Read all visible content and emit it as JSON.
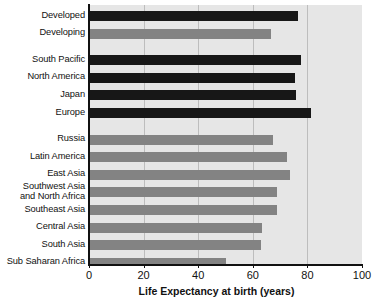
{
  "chart_data": {
    "type": "bar",
    "orientation": "horizontal",
    "title": "",
    "xlabel": "Life Expectancy at birth (years)",
    "ylabel": "",
    "xlim": [
      0,
      100
    ],
    "xticks": [
      0,
      20,
      40,
      60,
      80,
      100
    ],
    "grid": true,
    "legend": "none",
    "colors": {
      "dark_series": "#171717",
      "light_series": "#838383",
      "plot_background": "#e6e6e6",
      "gridline": "#bdbdbd",
      "axis": "#111111",
      "text": "#111111"
    },
    "categories": [
      "Developed",
      "Developing",
      "South Pacific",
      "North America",
      "Japan",
      "Europe",
      "Russia",
      "Latin America",
      "East Asia",
      "Southwest Asia and North Africa",
      "Southeast Asia",
      "Central Asia",
      "South Asia",
      "Sub Saharan Africa"
    ],
    "values": [
      76.5,
      66.5,
      77.5,
      75.5,
      76.0,
      81.5,
      67.5,
      72.5,
      73.5,
      69.0,
      69.0,
      63.5,
      63.0,
      50.0
    ],
    "bars": [
      {
        "label": "Developed",
        "label_lines": [
          "Developed"
        ],
        "value": 76.5,
        "shade": "dark",
        "group": 0
      },
      {
        "label": "Developing",
        "label_lines": [
          "Developing"
        ],
        "value": 66.5,
        "shade": "light",
        "group": 0
      },
      {
        "label": "South Pacific",
        "label_lines": [
          "South Pacific"
        ],
        "value": 77.5,
        "shade": "dark",
        "group": 1
      },
      {
        "label": "North America",
        "label_lines": [
          "North America"
        ],
        "value": 75.5,
        "shade": "dark",
        "group": 1
      },
      {
        "label": "Japan",
        "label_lines": [
          "Japan"
        ],
        "value": 76.0,
        "shade": "dark",
        "group": 1
      },
      {
        "label": "Europe",
        "label_lines": [
          "Europe"
        ],
        "value": 81.5,
        "shade": "dark",
        "group": 1
      },
      {
        "label": "Russia",
        "label_lines": [
          "Russia"
        ],
        "value": 67.5,
        "shade": "light",
        "group": 2
      },
      {
        "label": "Latin America",
        "label_lines": [
          "Latin America"
        ],
        "value": 72.5,
        "shade": "light",
        "group": 2
      },
      {
        "label": "East Asia",
        "label_lines": [
          "East Asia"
        ],
        "value": 73.5,
        "shade": "light",
        "group": 2
      },
      {
        "label": "Southwest Asia and North Africa",
        "label_lines": [
          "Southwest Asia",
          "and North Africa"
        ],
        "value": 69.0,
        "shade": "light",
        "group": 2
      },
      {
        "label": "Southeast Asia",
        "label_lines": [
          "Southeast Asia"
        ],
        "value": 69.0,
        "shade": "light",
        "group": 2
      },
      {
        "label": "Central Asia",
        "label_lines": [
          "Central Asia"
        ],
        "value": 63.5,
        "shade": "light",
        "group": 2
      },
      {
        "label": "South Asia",
        "label_lines": [
          "South Asia"
        ],
        "value": 63.0,
        "shade": "light",
        "group": 2
      },
      {
        "label": "Sub Saharan Africa",
        "label_lines": [
          "Sub Saharan Africa"
        ],
        "value": 50.0,
        "shade": "light",
        "group": 2
      }
    ]
  },
  "axis": {
    "x_tick_labels": [
      "0",
      "20",
      "40",
      "60",
      "80",
      "100"
    ],
    "x_axis_title": "Life Expectancy at birth (years)"
  },
  "layout": {
    "plot_left_px": 89,
    "plot_top_px": 5,
    "plot_width_px": 273,
    "plot_height_px": 260,
    "bar_height_px": 10,
    "row_pitch_px": 17.6,
    "group_gap_px": 9
  }
}
